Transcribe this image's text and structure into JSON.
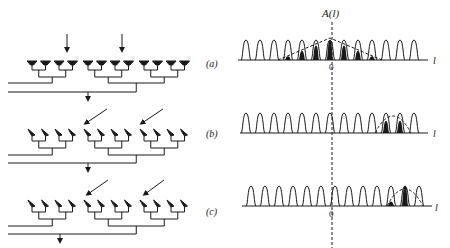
{
  "figure": {
    "panels": [
      {
        "id": "a",
        "label": "(a)",
        "beam_direction": "broadside",
        "highlight_pulses": [
          -3,
          -2,
          -1,
          0,
          1,
          2,
          3
        ],
        "envelope_center": 0
      },
      {
        "id": "b",
        "label": "(b)",
        "beam_direction": "steered",
        "highlight_pulses": [
          4,
          5
        ],
        "envelope_center": 4.5
      },
      {
        "id": "c",
        "label": "(c)",
        "beam_direction": "steered-further",
        "highlight_pulses": [
          4,
          5
        ],
        "envelope_center": 5
      }
    ],
    "axis": {
      "ylabel": "A(l)",
      "xlabel": "l",
      "origin_label": "0"
    },
    "array": {
      "elements_per_row": 12,
      "groups": 3,
      "elements_per_group": 4
    },
    "colors": {
      "ink": "#1a1a1a",
      "background": "#ffffff"
    }
  }
}
